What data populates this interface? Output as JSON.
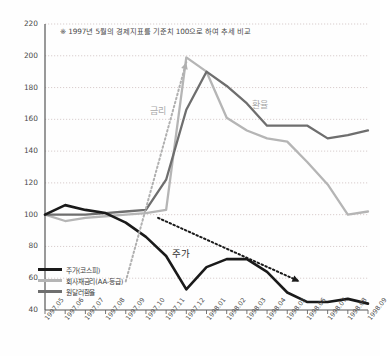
{
  "note": "※ 1997년 5월의 경제지표를 기준치 100으로 하여 추세 비교",
  "annotations": {
    "rate": "금리",
    "fx": "환율",
    "stock": "주가"
  },
  "legend": [
    {
      "label": "주가(코스피)",
      "color": "#1a1a1a"
    },
    {
      "label": "회사채금리(AA-등급)",
      "color": "#b5b5b5"
    },
    {
      "label": "원달러환율",
      "color": "#6e6e6e"
    }
  ],
  "chart_data": {
    "type": "line",
    "title": "",
    "subtitle": "※ 1997년 5월의 경제지표를 기준치 100으로 하여 추세 비교",
    "xlabel": "",
    "ylabel": "",
    "ylim": [
      40,
      220
    ],
    "ytick_step": 20,
    "yticks": [
      220,
      200,
      180,
      160,
      140,
      120,
      100,
      80,
      60,
      40
    ],
    "grid": true,
    "legend_position": "bottom-left",
    "categories": [
      "1997.05",
      "1997.06",
      "1997.07",
      "1997.08",
      "1997.09",
      "1997.10",
      "1997.11",
      "1997.12",
      "1998.01",
      "1998.02",
      "1998.03",
      "1998.04",
      "1998.05",
      "1998.06",
      "1998.07",
      "1998.08",
      "1998.09"
    ],
    "series": [
      {
        "name": "주가(코스피)",
        "color": "#1a1a1a",
        "values": [
          100,
          106,
          103,
          101,
          95,
          86,
          74,
          53,
          67,
          72,
          72,
          64,
          51,
          45,
          45,
          47,
          44
        ]
      },
      {
        "name": "회사채금리(AA-등급)",
        "color": "#b5b5b5",
        "values": [
          100,
          96,
          98,
          99,
          100,
          101,
          103,
          199,
          190,
          161,
          153,
          148,
          146,
          133,
          119,
          100,
          102
        ]
      },
      {
        "name": "원달러환율",
        "color": "#6e6e6e",
        "values": [
          100,
          100,
          100,
          101,
          102,
          103,
          122,
          166,
          190,
          181,
          170,
          156,
          156,
          156,
          148,
          150,
          153
        ]
      }
    ],
    "trend_arrows": [
      {
        "name": "rate-up-arrow",
        "from": [
          4.0,
          58
        ],
        "to": [
          7.0,
          196
        ],
        "style": "dotted",
        "color": "#b0b0b0"
      },
      {
        "name": "stock-down-arrow",
        "from": [
          5.6,
          98
        ],
        "to": [
          12.6,
          58
        ],
        "style": "dotted",
        "color": "#1a1a1a"
      }
    ]
  }
}
